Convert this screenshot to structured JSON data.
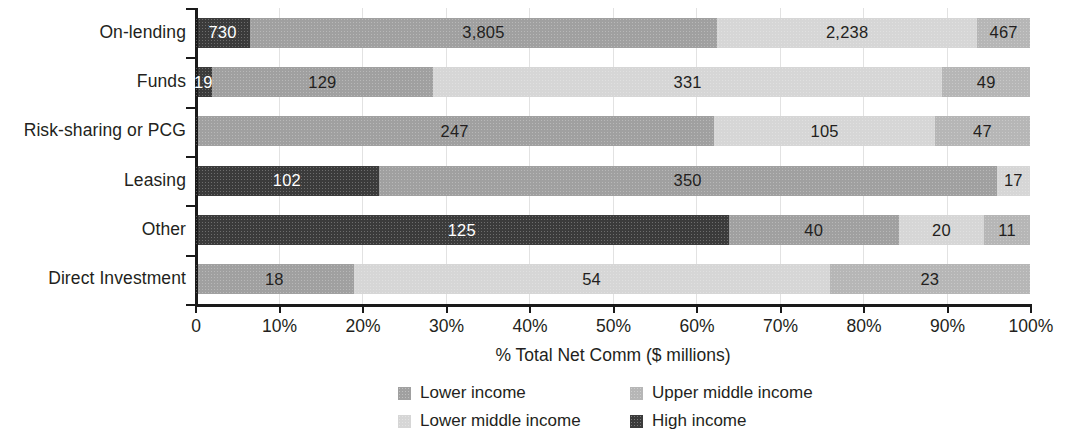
{
  "chart_data": {
    "type": "bar",
    "subtype": "stacked-horizontal-100pct",
    "title": "",
    "xlabel": "% Total Net Comm ($ millions)",
    "ylabel": "",
    "xlim": [
      0,
      100
    ],
    "xticks": [
      "0",
      "10%",
      "20%",
      "30%",
      "40%",
      "50%",
      "60%",
      "70%",
      "80%",
      "90%",
      "100%"
    ],
    "xtick_values": [
      0,
      10,
      20,
      30,
      40,
      50,
      60,
      70,
      80,
      90,
      100
    ],
    "grid": true,
    "legend_position": "bottom",
    "categories": [
      "On-lending",
      "Funds",
      "Risk-sharing or PCG",
      "Leasing",
      "Other",
      "Direct Investment"
    ],
    "series": [
      {
        "name": "High income",
        "color": "#3b3b3b",
        "tone": "dark",
        "values": [
          730,
          19,
          null,
          102,
          125,
          null
        ],
        "percents": [
          6.6,
          2.0,
          0,
          22.0,
          63.9,
          0
        ]
      },
      {
        "name": "Lower income",
        "color": "#a0a0a0",
        "tone": "mid",
        "values": [
          3805,
          129,
          247,
          350,
          40,
          18
        ],
        "percents": [
          55.9,
          26.5,
          62.2,
          74.0,
          20.4,
          19.0
        ]
      },
      {
        "name": "Lower middle income",
        "color": "#d6d6d6",
        "tone": "light",
        "values": [
          2238,
          331,
          105,
          17,
          20,
          54
        ],
        "percents": [
          31.2,
          61.0,
          26.4,
          4.0,
          10.2,
          57.0
        ]
      },
      {
        "name": "Upper middle income",
        "color": "#b6b6b6",
        "tone": "midlight",
        "values": [
          467,
          49,
          47,
          null,
          11,
          23
        ],
        "percents": [
          6.3,
          10.5,
          11.4,
          0,
          5.5,
          24.0
        ]
      }
    ],
    "bars": [
      {
        "category": "On-lending",
        "segments": [
          {
            "series": "High income",
            "tone": "dark",
            "label": "730",
            "value": 730,
            "pct": 6.6
          },
          {
            "series": "Lower income",
            "tone": "mid",
            "label": "3,805",
            "value": 3805,
            "pct": 55.9
          },
          {
            "series": "Lower middle income",
            "tone": "light",
            "label": "2,238",
            "value": 2238,
            "pct": 31.2
          },
          {
            "series": "Upper middle income",
            "tone": "midlight",
            "label": "467",
            "value": 467,
            "pct": 6.3
          }
        ]
      },
      {
        "category": "Funds",
        "segments": [
          {
            "series": "High income",
            "tone": "dark",
            "label": "19",
            "value": 19,
            "pct": 2.0
          },
          {
            "series": "Lower income",
            "tone": "mid",
            "label": "129",
            "value": 129,
            "pct": 26.5
          },
          {
            "series": "Lower middle income",
            "tone": "light",
            "label": "331",
            "value": 331,
            "pct": 61.0
          },
          {
            "series": "Upper middle income",
            "tone": "midlight",
            "label": "49",
            "value": 49,
            "pct": 10.5
          }
        ]
      },
      {
        "category": "Risk-sharing or PCG",
        "segments": [
          {
            "series": "Lower income",
            "tone": "mid",
            "label": "247",
            "value": 247,
            "pct": 62.2
          },
          {
            "series": "Lower middle income",
            "tone": "light",
            "label": "105",
            "value": 105,
            "pct": 26.4
          },
          {
            "series": "Upper middle income",
            "tone": "midlight",
            "label": "47",
            "value": 47,
            "pct": 11.4
          }
        ]
      },
      {
        "category": "Leasing",
        "segments": [
          {
            "series": "High income",
            "tone": "dark",
            "label": "102",
            "value": 102,
            "pct": 22.0
          },
          {
            "series": "Lower income",
            "tone": "mid",
            "label": "350",
            "value": 350,
            "pct": 74.0
          },
          {
            "series": "Lower middle income",
            "tone": "light",
            "label": "17",
            "value": 17,
            "pct": 4.0
          }
        ]
      },
      {
        "category": "Other",
        "segments": [
          {
            "series": "High income",
            "tone": "dark",
            "label": "125",
            "value": 125,
            "pct": 63.9
          },
          {
            "series": "Lower income",
            "tone": "mid",
            "label": "40",
            "value": 40,
            "pct": 20.4
          },
          {
            "series": "Lower middle income",
            "tone": "light",
            "label": "20",
            "value": 20,
            "pct": 10.2
          },
          {
            "series": "Upper middle income",
            "tone": "midlight",
            "label": "11",
            "value": 11,
            "pct": 5.5
          }
        ]
      },
      {
        "category": "Direct Investment",
        "segments": [
          {
            "series": "Lower income",
            "tone": "mid",
            "label": "18",
            "value": 18,
            "pct": 19.0
          },
          {
            "series": "Lower middle income",
            "tone": "light",
            "label": "54",
            "value": 54,
            "pct": 57.0
          },
          {
            "series": "Upper middle income",
            "tone": "midlight",
            "label": "23",
            "value": 23,
            "pct": 24.0
          }
        ]
      }
    ],
    "legend": [
      {
        "label": "Lower income",
        "color": "#a0a0a0",
        "tone": "mid"
      },
      {
        "label": "Upper middle income",
        "color": "#b6b6b6",
        "tone": "midlight"
      },
      {
        "label": "Lower middle income",
        "color": "#d6d6d6",
        "tone": "light"
      },
      {
        "label": "High income",
        "color": "#3b3b3b",
        "tone": "dark"
      }
    ]
  },
  "colors": {
    "axis": "#1a1a1a",
    "text": "#231f20",
    "grid": "#e2e2e2",
    "background": "#ffffff",
    "dark": "#3b3b3b",
    "mid": "#a0a0a0",
    "midlight": "#b6b6b6",
    "light": "#d6d6d6"
  }
}
